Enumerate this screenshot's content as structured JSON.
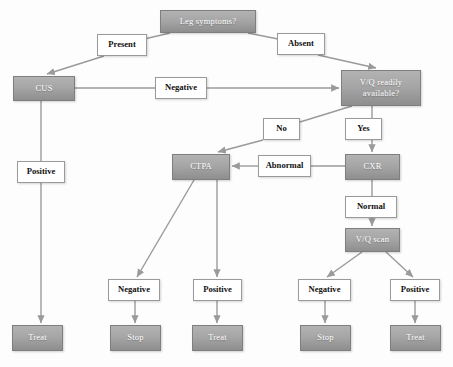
{
  "diagram": {
    "type": "flowchart",
    "colors": {
      "node_fill_top": "#b2b2b2",
      "node_fill_bottom": "#8e8e8e",
      "node_border": "#7f7f7f",
      "node_text": "#ffffff",
      "label_fill": "#ffffff",
      "label_border": "#9a9a9a",
      "label_text": "#111111",
      "edge": "#9a9a9a"
    },
    "nodes": [
      {
        "id": "leg_symptoms",
        "label": "Leg symptoms?",
        "kind": "decision",
        "x": 160,
        "y": 10,
        "w": 96,
        "h": 23
      },
      {
        "id": "cus",
        "label": "CUS",
        "kind": "process",
        "x": 13,
        "y": 76,
        "w": 62,
        "h": 25
      },
      {
        "id": "vq_available",
        "label": "V/Q readily available?",
        "kind": "decision",
        "x": 341,
        "y": 70,
        "w": 80,
        "h": 36
      },
      {
        "id": "ctpa",
        "label": "CTPA",
        "kind": "process",
        "x": 172,
        "y": 154,
        "w": 58,
        "h": 26
      },
      {
        "id": "cxr",
        "label": "CXR",
        "kind": "process",
        "x": 345,
        "y": 154,
        "w": 55,
        "h": 26
      },
      {
        "id": "vq_scan",
        "label": "V/Q scan",
        "kind": "process",
        "x": 345,
        "y": 228,
        "w": 55,
        "h": 24
      },
      {
        "id": "treat_cus",
        "label": "Treat",
        "kind": "terminal",
        "x": 12,
        "y": 325,
        "w": 51,
        "h": 26
      },
      {
        "id": "stop_ctpa",
        "label": "Stop",
        "kind": "terminal",
        "x": 110,
        "y": 325,
        "w": 51,
        "h": 26
      },
      {
        "id": "treat_ctpa",
        "label": "Treat",
        "kind": "terminal",
        "x": 192,
        "y": 325,
        "w": 51,
        "h": 26
      },
      {
        "id": "stop_vq",
        "label": "Stop",
        "kind": "terminal",
        "x": 300,
        "y": 325,
        "w": 51,
        "h": 26
      },
      {
        "id": "treat_vq",
        "label": "Treat",
        "kind": "terminal",
        "x": 390,
        "y": 325,
        "w": 51,
        "h": 26
      }
    ],
    "edge_labels": [
      {
        "id": "present",
        "label": "Present",
        "x": 97,
        "y": 34,
        "w": 50,
        "h": 22
      },
      {
        "id": "absent",
        "label": "Absent",
        "x": 277,
        "y": 33,
        "w": 48,
        "h": 22
      },
      {
        "id": "negative_cus",
        "label": "Negative",
        "x": 155,
        "y": 77,
        "w": 52,
        "h": 22
      },
      {
        "id": "positive_cus",
        "label": "Positive",
        "x": 17,
        "y": 161,
        "w": 48,
        "h": 22
      },
      {
        "id": "no_vq",
        "label": "No",
        "x": 263,
        "y": 118,
        "w": 37,
        "h": 22
      },
      {
        "id": "yes_vq",
        "label": "Yes",
        "x": 345,
        "y": 118,
        "w": 37,
        "h": 22
      },
      {
        "id": "abnormal",
        "label": "Abnormal",
        "x": 258,
        "y": 155,
        "w": 53,
        "h": 22
      },
      {
        "id": "normal",
        "label": "Normal",
        "x": 345,
        "y": 196,
        "w": 52,
        "h": 22
      },
      {
        "id": "negative_ctpa",
        "label": "Negative",
        "x": 108,
        "y": 279,
        "w": 52,
        "h": 22
      },
      {
        "id": "positive_ctpa",
        "label": "Positive",
        "x": 193,
        "y": 279,
        "w": 49,
        "h": 22
      },
      {
        "id": "negative_vq",
        "label": "Negative",
        "x": 298,
        "y": 279,
        "w": 53,
        "h": 22
      },
      {
        "id": "positive_vq",
        "label": "Positive",
        "x": 390,
        "y": 279,
        "w": 50,
        "h": 22
      }
    ]
  }
}
